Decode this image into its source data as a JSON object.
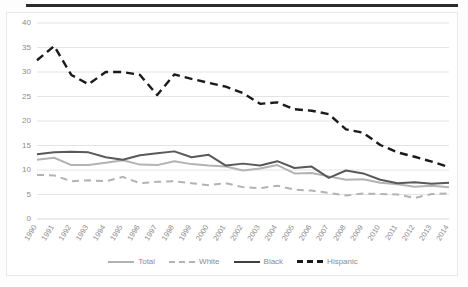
{
  "chart_data": {
    "type": "line",
    "title": "",
    "subtitle": "",
    "xlabel": "",
    "ylabel": "",
    "ylim": [
      0,
      40
    ],
    "yticks": [
      0,
      5,
      10,
      15,
      20,
      25,
      30,
      35,
      40
    ],
    "grid": true,
    "legend_position": "bottom",
    "categories": [
      "1990",
      "1991",
      "1992",
      "1993",
      "1994",
      "1995",
      "1996",
      "1997",
      "1998",
      "1999",
      "2000",
      "2001",
      "2002",
      "2003",
      "2004",
      "2005",
      "2006",
      "2007",
      "2008",
      "2009",
      "2010",
      "2011",
      "2012",
      "2013",
      "2014"
    ],
    "series": [
      {
        "name": "Total",
        "color": "#b3b3b3",
        "style": "solid",
        "values": [
          12.1,
          12.5,
          11.0,
          11.0,
          11.5,
          12.0,
          11.1,
          11.0,
          11.8,
          11.2,
          10.9,
          10.7,
          9.9,
          10.3,
          11.0,
          9.3,
          9.4,
          8.7,
          8.0,
          8.1,
          7.4,
          7.1,
          6.6,
          6.8,
          6.5
        ]
      },
      {
        "name": "White",
        "color": "#b3b3b3",
        "style": "dashed",
        "values": [
          9.0,
          8.9,
          7.7,
          7.9,
          7.7,
          8.6,
          7.3,
          7.6,
          7.7,
          7.3,
          6.9,
          7.3,
          6.5,
          6.3,
          6.8,
          6.0,
          5.8,
          5.3,
          4.8,
          5.2,
          5.1,
          5.0,
          4.3,
          5.1,
          5.2
        ]
      },
      {
        "name": "Black",
        "color": "#595959",
        "style": "solid",
        "values": [
          13.2,
          13.6,
          13.7,
          13.6,
          12.6,
          12.1,
          13.0,
          13.4,
          13.8,
          12.6,
          13.1,
          10.9,
          11.3,
          10.9,
          11.8,
          10.4,
          10.7,
          8.4,
          9.9,
          9.3,
          8.0,
          7.3,
          7.5,
          7.2,
          7.4
        ]
      },
      {
        "name": "Hispanic",
        "color": "#1a1a1a",
        "style": "dashed",
        "values": [
          32.4,
          35.3,
          29.4,
          27.5,
          30.0,
          30.0,
          29.4,
          25.3,
          29.5,
          28.6,
          27.8,
          27.0,
          25.7,
          23.5,
          23.8,
          22.4,
          22.1,
          21.4,
          18.3,
          17.6,
          15.1,
          13.6,
          12.7,
          11.7,
          10.6
        ]
      }
    ]
  },
  "legend": {
    "items": [
      {
        "label": "Total"
      },
      {
        "label": "White"
      },
      {
        "label": "Black"
      },
      {
        "label": "Hispanic"
      }
    ]
  }
}
